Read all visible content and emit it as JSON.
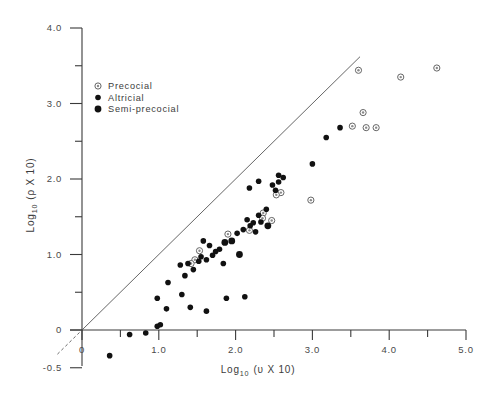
{
  "figure": {
    "background_color": "#ffffff",
    "point_color_filled": "#111111",
    "point_color_open_stroke": "#666666",
    "axis_color": "#3a3a3a",
    "reference_line_color": "#555555"
  },
  "chart_data": {
    "type": "scatter",
    "title": "",
    "xlabel": "Log10 (v X 10)",
    "xlabel_base": "Log",
    "xlabel_sub": "10",
    "xlabel_rest": "(υ X 10)",
    "ylabel": "Log10 (ρ X 10)",
    "ylabel_base": "Log",
    "ylabel_sub": "10",
    "ylabel_rest": "(ρ X 10)",
    "xlim": [
      -0.35,
      5.2
    ],
    "ylim": [
      -0.55,
      4.15
    ],
    "xticks": [
      0,
      1.0,
      2.0,
      3.0,
      4.0,
      5.0
    ],
    "xtick_labels": [
      "0",
      "1.0",
      "2.0",
      "3.0",
      "4.0",
      "5.0"
    ],
    "x_minor_ticks": [
      0.5,
      1.5,
      2.5,
      3.5,
      4.5
    ],
    "yticks": [
      -0.5,
      0,
      1.0,
      2.0,
      3.0,
      4.0
    ],
    "ytick_labels": [
      "-0.5",
      "0",
      "1.0",
      "2.0",
      "3.0",
      "4.0"
    ],
    "y_minor_ticks": [
      0.5,
      1.5,
      2.5,
      3.5
    ],
    "grid": false,
    "legend_position": "upper-left-inside",
    "reference_line": {
      "label": "identity-line",
      "solid_from": [
        0.0,
        0.0
      ],
      "solid_to": [
        3.62,
        3.62
      ],
      "dashed_from": [
        -0.32,
        -0.32
      ],
      "dashed_to": [
        0.0,
        0.0
      ]
    },
    "legend": [
      {
        "label": "Precocial",
        "marker": "open-circle"
      },
      {
        "label": "Altricial",
        "marker": "filled-circle"
      },
      {
        "label": "Semi-precocial",
        "marker": "filled-circle-large"
      }
    ],
    "series": [
      {
        "name": "Precocial",
        "marker": "open-circle",
        "points": [
          [
            3.6,
            3.44
          ],
          [
            4.15,
            3.35
          ],
          [
            4.62,
            3.47
          ],
          [
            3.52,
            2.7
          ],
          [
            3.7,
            2.68
          ],
          [
            3.83,
            2.68
          ],
          [
            3.66,
            2.88
          ],
          [
            2.98,
            1.72
          ],
          [
            2.59,
            1.82
          ],
          [
            2.53,
            1.79
          ],
          [
            2.36,
            1.55
          ],
          [
            2.35,
            1.48
          ],
          [
            2.18,
            1.32
          ],
          [
            1.9,
            1.27
          ],
          [
            1.53,
            1.05
          ],
          [
            1.47,
            0.93
          ],
          [
            1.42,
            0.88
          ],
          [
            2.47,
            1.45
          ]
        ]
      },
      {
        "name": "Altricial",
        "marker": "filled-circle",
        "points": [
          [
            0.36,
            -0.34
          ],
          [
            0.62,
            -0.06
          ],
          [
            0.83,
            -0.04
          ],
          [
            0.98,
            0.05
          ],
          [
            1.02,
            0.07
          ],
          [
            1.1,
            0.28
          ],
          [
            1.12,
            0.63
          ],
          [
            0.98,
            0.42
          ],
          [
            1.3,
            0.47
          ],
          [
            1.34,
            0.72
          ],
          [
            1.28,
            0.86
          ],
          [
            1.38,
            0.88
          ],
          [
            1.45,
            0.8
          ],
          [
            1.52,
            0.91
          ],
          [
            1.55,
            0.97
          ],
          [
            1.62,
            0.93
          ],
          [
            1.7,
            0.99
          ],
          [
            1.74,
            1.04
          ],
          [
            1.79,
            1.07
          ],
          [
            1.66,
            1.12
          ],
          [
            1.58,
            1.18
          ],
          [
            1.84,
            0.88
          ],
          [
            1.41,
            0.3
          ],
          [
            1.62,
            0.25
          ],
          [
            1.88,
            0.42
          ],
          [
            2.12,
            0.44
          ],
          [
            2.02,
            1.28
          ],
          [
            2.1,
            1.33
          ],
          [
            2.19,
            1.38
          ],
          [
            2.23,
            1.42
          ],
          [
            2.26,
            1.3
          ],
          [
            2.15,
            1.46
          ],
          [
            2.3,
            1.52
          ],
          [
            2.33,
            1.43
          ],
          [
            2.4,
            1.6
          ],
          [
            2.48,
            1.92
          ],
          [
            2.52,
            1.85
          ],
          [
            2.56,
            1.96
          ],
          [
            2.3,
            1.97
          ],
          [
            2.18,
            1.88
          ],
          [
            2.56,
            2.05
          ],
          [
            2.62,
            2.02
          ],
          [
            3.0,
            2.2
          ],
          [
            3.18,
            2.55
          ],
          [
            3.36,
            2.68
          ]
        ]
      },
      {
        "name": "Semi-precocial",
        "marker": "filled-circle-large",
        "points": [
          [
            1.95,
            1.18
          ],
          [
            2.05,
            1.0
          ],
          [
            1.86,
            1.16
          ],
          [
            2.42,
            1.38
          ]
        ]
      }
    ]
  }
}
